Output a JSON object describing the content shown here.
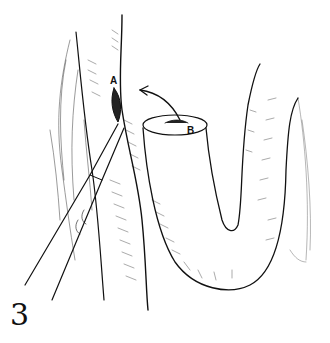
{
  "figure": {
    "number": "3",
    "labels": {
      "a": "A",
      "b": "B"
    },
    "elements": [
      "vertical-bowel-segment",
      "incision-A",
      "scalpel",
      "curved-arrow",
      "bowel-loop-open-end-B",
      "mesentery"
    ],
    "colors": {
      "line": "#111111",
      "background": "#ffffff"
    }
  }
}
